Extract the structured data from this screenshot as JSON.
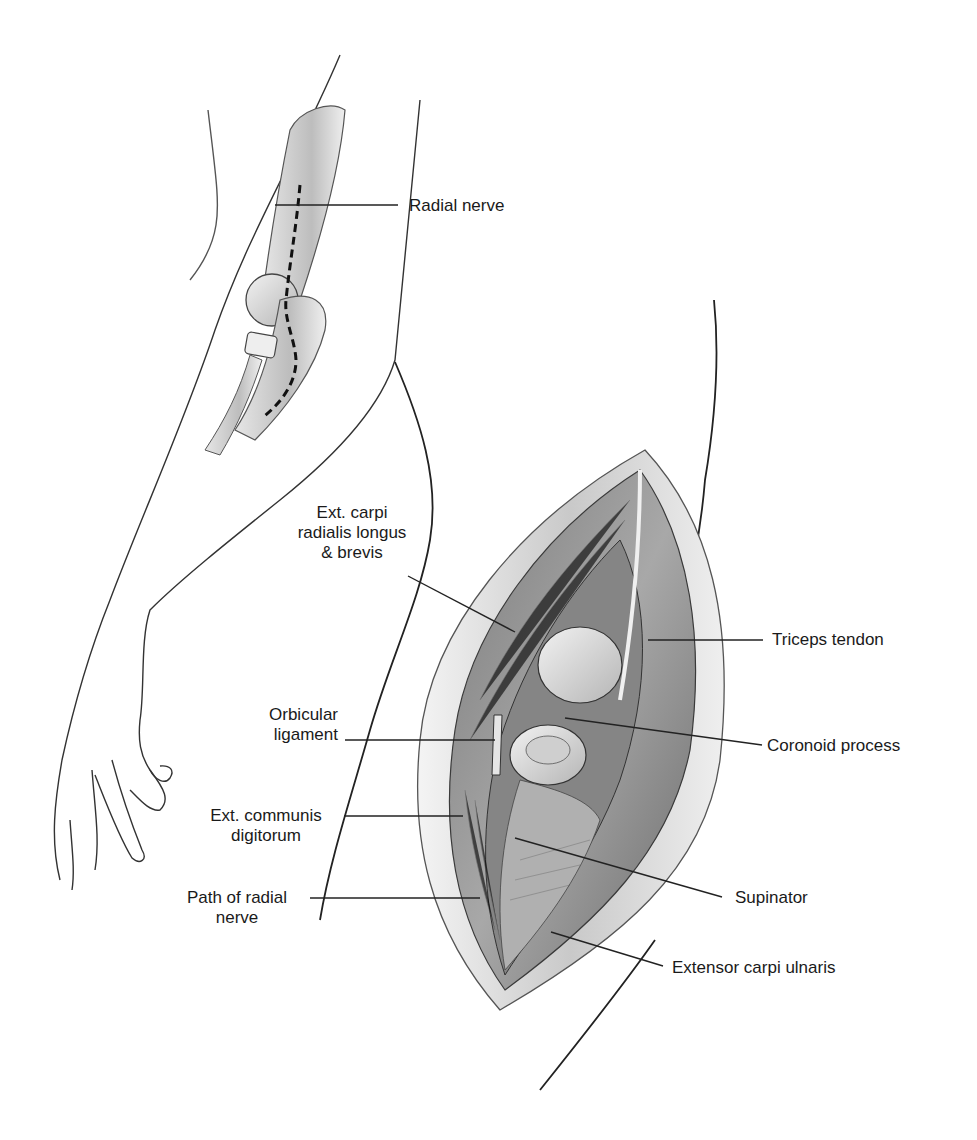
{
  "figure": {
    "labels": {
      "radial_nerve": "Radial nerve",
      "ext_carpi_radialis": [
        "Ext. carpi",
        "radialis longus",
        "& brevis"
      ],
      "triceps_tendon": "Triceps tendon",
      "orbicular_ligament": [
        "Orbicular",
        "ligament"
      ],
      "coronoid_process": "Coronoid process",
      "ext_communis_digitorum": [
        "Ext. communis",
        "digitorum"
      ],
      "path_of_radial_nerve": [
        "Path of radial",
        "nerve"
      ],
      "supinator": "Supinator",
      "extensor_carpi_ulnaris": "Extensor carpi ulnaris"
    },
    "colors": {
      "ink": "#1a1a1a",
      "muscle_dark": "#6e6e6e",
      "muscle_mid": "#9a9a9a",
      "skin_edge": "#d8d8d8",
      "bone": "#e8e8e8"
    }
  }
}
